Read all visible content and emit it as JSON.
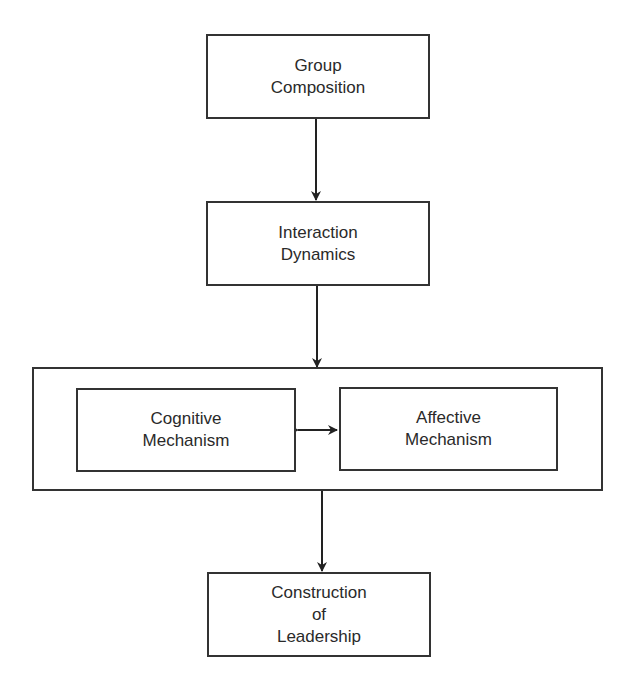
{
  "diagram": {
    "type": "flowchart",
    "nodes": [
      {
        "id": "group-composition",
        "lines": [
          "Group",
          "Composition"
        ]
      },
      {
        "id": "interaction-dynamics",
        "lines": [
          "Interaction",
          "Dynamics"
        ]
      },
      {
        "id": "cognitive-mechanism",
        "lines": [
          "Cognitive",
          "Mechanism"
        ]
      },
      {
        "id": "affective-mechanism",
        "lines": [
          "Affective",
          "Mechanism"
        ]
      },
      {
        "id": "construction-of-leadership",
        "lines": [
          "Construction",
          "of",
          "Leadership"
        ]
      }
    ],
    "edges": [
      {
        "from": "group-composition",
        "to": "interaction-dynamics",
        "direction": "forward"
      },
      {
        "from": "interaction-dynamics",
        "to": "mechanisms-group",
        "direction": "forward"
      },
      {
        "from": "cognitive-mechanism",
        "to": "affective-mechanism",
        "direction": "bidirectional"
      },
      {
        "from": "mechanisms-group",
        "to": "construction-of-leadership",
        "direction": "forward"
      }
    ],
    "colors": {
      "stroke": "#333333",
      "text": "#2a2a2a",
      "background": "#ffffff"
    }
  }
}
